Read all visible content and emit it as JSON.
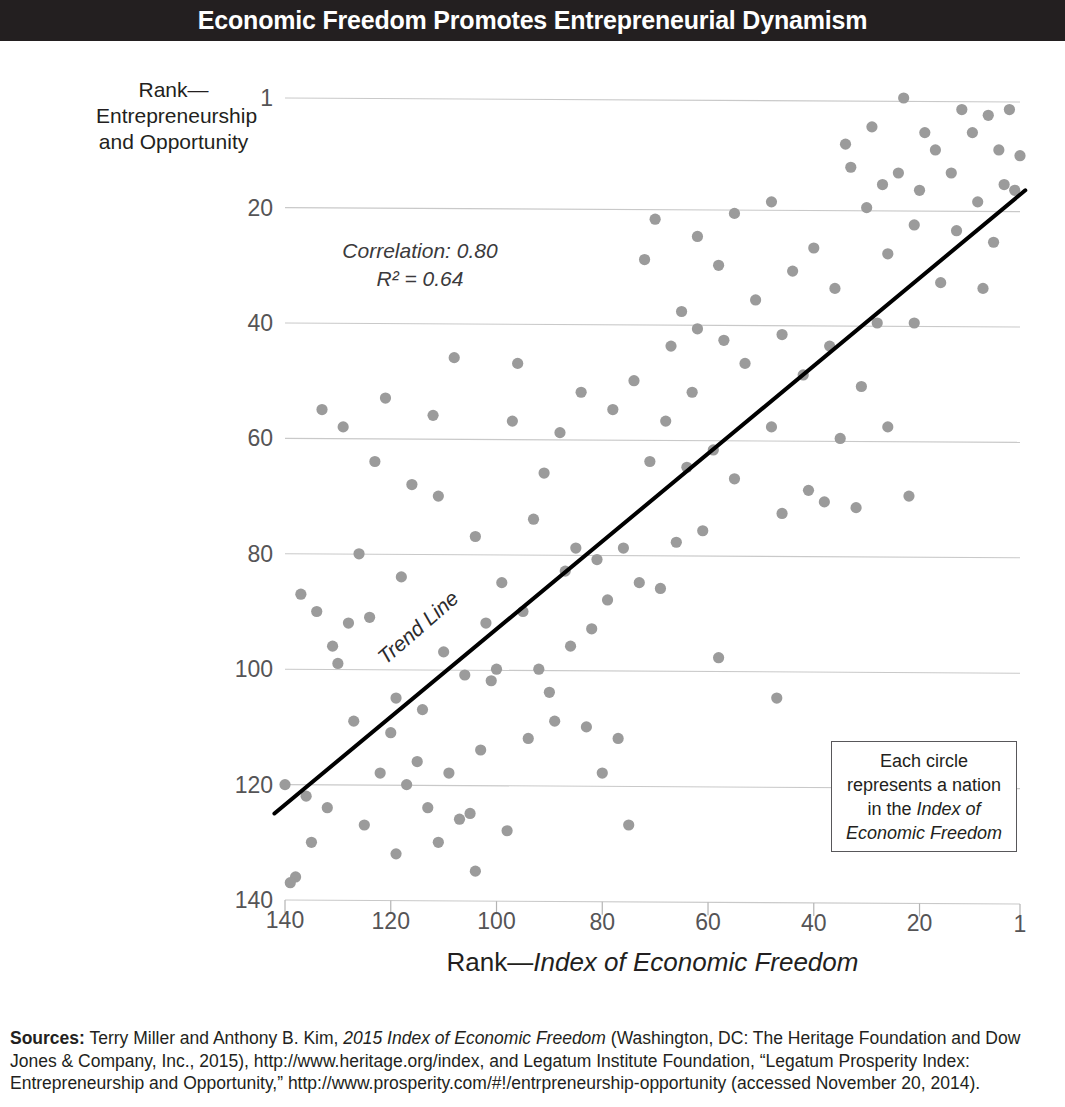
{
  "title": "Economic Freedom Promotes Entrepreneurial Dynamism",
  "y_axis_caption": "Rank—\nEntrepreneurship\nand Opportunity",
  "annotations": {
    "correlation": "Correlation: 0.80",
    "r_squared": "R² = 0.64",
    "trend_label": "Trend Line"
  },
  "legend": {
    "line1": "Each circle",
    "line2": "represents a nation",
    "line3": "in the ",
    "line3_em": "Index of",
    "line4_em": "Economic Freedom"
  },
  "x_axis_title_prefix": "Rank—",
  "x_axis_title_em": "Index of Economic Freedom",
  "sources": {
    "lead": "Sources:",
    "part1": " Terry Miller and Anthony B. Kim, ",
    "em1": "2015 Index of Economic Freedom",
    "part2": " (Washington, DC: The Heritage Foundation and Dow Jones & Company, Inc., 2015), http://www.heritage.org/index, and Legatum Institute Foundation, “Legatum Prosperity Index: Entrepreneurship and Opportunity,” http://www.prosperity.com/#!/entrpreneurship-opportunity (accessed November 20, 2014)."
  },
  "colors": {
    "banner": "#231f20",
    "dot": "#9b9b9b",
    "gridline": "#c9c9c9",
    "trend": "#000000",
    "tick_text": "#555456"
  },
  "chart_data": {
    "type": "scatter",
    "title": "Economic Freedom Promotes Entrepreneurial Dynamism",
    "xlabel": "Rank—Index of Economic Freedom",
    "ylabel": "Rank—Entrepreneurship and Opportunity",
    "xlim": [
      140,
      1
    ],
    "ylim": [
      140,
      1
    ],
    "x_inverted": true,
    "y_inverted": true,
    "xticks": [
      140,
      120,
      100,
      80,
      60,
      40,
      20,
      1
    ],
    "yticks": [
      1,
      20,
      40,
      60,
      80,
      100,
      120,
      140
    ],
    "grid": "horizontal",
    "correlation": 0.8,
    "r_squared": 0.64,
    "trendline": {
      "x0": 142,
      "y0": 125,
      "x1": 0,
      "y1": 17
    },
    "points": [
      [
        23,
        1
      ],
      [
        12,
        3
      ],
      [
        7,
        4
      ],
      [
        3,
        3
      ],
      [
        29,
        6
      ],
      [
        19,
        7
      ],
      [
        10,
        7
      ],
      [
        34,
        9
      ],
      [
        17,
        10
      ],
      [
        5,
        10
      ],
      [
        1,
        11
      ],
      [
        33,
        13
      ],
      [
        24,
        14
      ],
      [
        14,
        14
      ],
      [
        27,
        16
      ],
      [
        20,
        17
      ],
      [
        4,
        16
      ],
      [
        2,
        17
      ],
      [
        48,
        19
      ],
      [
        30,
        20
      ],
      [
        9,
        19
      ],
      [
        55,
        21
      ],
      [
        21,
        23
      ],
      [
        62,
        25
      ],
      [
        13,
        24
      ],
      [
        70,
        22
      ],
      [
        6,
        26
      ],
      [
        40,
        27
      ],
      [
        26,
        28
      ],
      [
        72,
        29
      ],
      [
        58,
        30
      ],
      [
        44,
        31
      ],
      [
        36,
        34
      ],
      [
        16,
        33
      ],
      [
        8,
        34
      ],
      [
        51,
        36
      ],
      [
        65,
        38
      ],
      [
        62,
        41
      ],
      [
        28,
        40
      ],
      [
        21,
        40
      ],
      [
        46,
        42
      ],
      [
        37,
        44
      ],
      [
        67,
        44
      ],
      [
        57,
        43
      ],
      [
        108,
        46
      ],
      [
        96,
        47
      ],
      [
        53,
        47
      ],
      [
        42,
        49
      ],
      [
        74,
        50
      ],
      [
        63,
        52
      ],
      [
        121,
        53
      ],
      [
        84,
        52
      ],
      [
        31,
        51
      ],
      [
        112,
        56
      ],
      [
        78,
        55
      ],
      [
        97,
        57
      ],
      [
        68,
        57
      ],
      [
        133,
        55
      ],
      [
        129,
        58
      ],
      [
        88,
        59
      ],
      [
        48,
        58
      ],
      [
        26,
        58
      ],
      [
        35,
        60
      ],
      [
        59,
        62
      ],
      [
        123,
        64
      ],
      [
        64,
        65
      ],
      [
        71,
        64
      ],
      [
        116,
        68
      ],
      [
        91,
        66
      ],
      [
        55,
        67
      ],
      [
        41,
        69
      ],
      [
        111,
        70
      ],
      [
        38,
        71
      ],
      [
        32,
        72
      ],
      [
        22,
        70
      ],
      [
        46,
        73
      ],
      [
        93,
        74
      ],
      [
        61,
        76
      ],
      [
        66,
        78
      ],
      [
        76,
        79
      ],
      [
        85,
        79
      ],
      [
        104,
        77
      ],
      [
        81,
        81
      ],
      [
        126,
        80
      ],
      [
        118,
        84
      ],
      [
        87,
        83
      ],
      [
        99,
        85
      ],
      [
        73,
        85
      ],
      [
        69,
        86
      ],
      [
        79,
        88
      ],
      [
        137,
        87
      ],
      [
        134,
        90
      ],
      [
        128,
        92
      ],
      [
        124,
        91
      ],
      [
        95,
        90
      ],
      [
        102,
        92
      ],
      [
        82,
        93
      ],
      [
        58,
        98
      ],
      [
        131,
        96
      ],
      [
        130,
        99
      ],
      [
        110,
        97
      ],
      [
        86,
        96
      ],
      [
        92,
        100
      ],
      [
        100,
        100
      ],
      [
        106,
        101
      ],
      [
        101,
        102
      ],
      [
        47,
        105
      ],
      [
        119,
        105
      ],
      [
        90,
        104
      ],
      [
        114,
        107
      ],
      [
        89,
        109
      ],
      [
        127,
        109
      ],
      [
        120,
        111
      ],
      [
        83,
        110
      ],
      [
        94,
        112
      ],
      [
        77,
        112
      ],
      [
        103,
        114
      ],
      [
        115,
        116
      ],
      [
        109,
        118
      ],
      [
        122,
        118
      ],
      [
        117,
        120
      ],
      [
        80,
        118
      ],
      [
        140,
        120
      ],
      [
        136,
        122
      ],
      [
        113,
        124
      ],
      [
        132,
        124
      ],
      [
        105,
        125
      ],
      [
        107,
        126
      ],
      [
        125,
        127
      ],
      [
        98,
        128
      ],
      [
        75,
        127
      ],
      [
        135,
        130
      ],
      [
        111,
        130
      ],
      [
        119,
        132
      ],
      [
        138,
        136
      ],
      [
        139,
        137
      ],
      [
        104,
        135
      ]
    ]
  }
}
